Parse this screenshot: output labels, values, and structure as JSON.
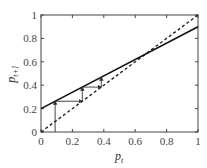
{
  "chart_data": {
    "type": "line",
    "title": "",
    "xlabel": "p_t",
    "ylabel": "p_{t+1}",
    "xlim": [
      0,
      1
    ],
    "ylim": [
      0,
      1
    ],
    "x_ticks": [
      "0",
      "0.2",
      "0.4",
      "0.6",
      "0.8",
      "1"
    ],
    "y_ticks": [
      "0",
      "0.2",
      "0.4",
      "0.6",
      "0.8",
      "1"
    ],
    "grid": false,
    "legend": null,
    "series": [
      {
        "name": "map p_{t+1} = 0.2 + 0.7 p_t",
        "style": "solid",
        "x": [
          0,
          1
        ],
        "y": [
          0.2,
          0.9
        ]
      },
      {
        "name": "identity p_{t+1} = p_t",
        "style": "dashed",
        "x": [
          0,
          1
        ],
        "y": [
          0,
          1
        ]
      },
      {
        "name": "cobweb iteration",
        "style": "thin-arrows",
        "x": [
          0.09,
          0.09,
          0.263,
          0.263,
          0.384,
          0.384
        ],
        "y": [
          0,
          0.263,
          0.263,
          0.384,
          0.384,
          0.469
        ]
      }
    ],
    "fixed_point": [
      0.667,
      0.667
    ]
  }
}
